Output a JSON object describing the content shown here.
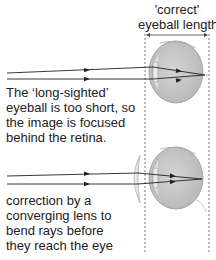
{
  "header": {
    "line1": "'correct'",
    "line2": "eyeball length"
  },
  "upper_panel": {
    "caption_lines": [
      "The ‘long-sighted’",
      "eyeball is too short, so",
      "the image is focused",
      "behind the retina."
    ]
  },
  "lower_panel": {
    "caption_lines": [
      "correction by a",
      "converging lens to",
      "bend rays before",
      "they reach the eye"
    ]
  },
  "colors": {
    "ray": "#2a2a2a",
    "eye_fill": "#c8c8c8",
    "eye_stroke": "#8a8a8a",
    "dashed": "#555555",
    "lens": "#e6e6e6"
  }
}
